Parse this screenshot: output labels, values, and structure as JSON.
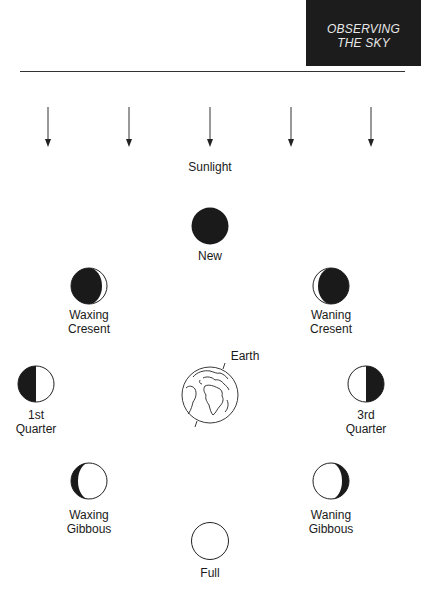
{
  "header": {
    "title_line1": "OBSERVING",
    "title_line2": "THE SKY",
    "background": "#1c1c1c",
    "text_color": "#e8e8e8"
  },
  "diagram": {
    "sunlight_label": "Sunlight",
    "sunlight_arrow_count": 5,
    "earth_label": "Earth",
    "phases": [
      {
        "id": "new",
        "line1": "New",
        "line2": ""
      },
      {
        "id": "waxing-crescent",
        "line1": "Waxing",
        "line2": "Cresent"
      },
      {
        "id": "waning-crescent",
        "line1": "Waning",
        "line2": "Cresent"
      },
      {
        "id": "first-quarter",
        "line1": "1st",
        "line2": "Quarter"
      },
      {
        "id": "third-quarter",
        "line1": "3rd",
        "line2": "Quarter"
      },
      {
        "id": "waxing-gibbous",
        "line1": "Waxing",
        "line2": "Gibbous"
      },
      {
        "id": "waning-gibbous",
        "line1": "Waning",
        "line2": "Gibbous"
      },
      {
        "id": "full",
        "line1": "Full",
        "line2": ""
      }
    ],
    "colors": {
      "shadow": "#1a1a1a",
      "lit": "#ffffff",
      "outline": "#222222"
    }
  }
}
